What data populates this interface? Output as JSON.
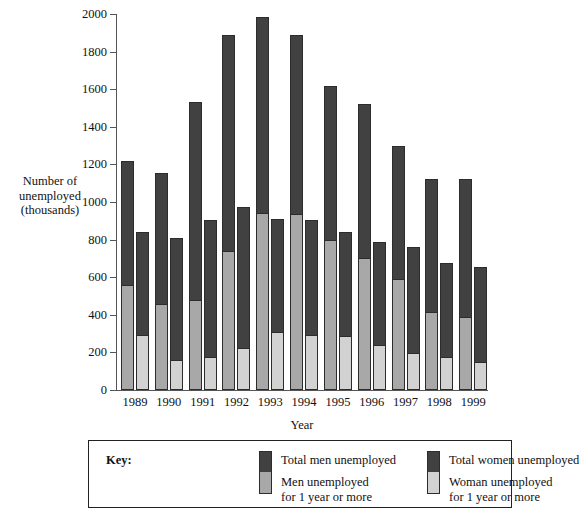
{
  "chart_data": {
    "type": "bar",
    "title": "",
    "xlabel": "Year",
    "ylabel": "Number of unemployed (thousands)",
    "ylim": [
      0,
      2000
    ],
    "ytick_step": 200,
    "yticks": [
      0,
      200,
      400,
      600,
      800,
      1000,
      1200,
      1400,
      1600,
      1800,
      2000
    ],
    "grid": false,
    "legend_position": "bottom",
    "categories": [
      "1989",
      "1990",
      "1991",
      "1992",
      "1993",
      "1994",
      "1995",
      "1996",
      "1997",
      "1998",
      "1999"
    ],
    "series": [
      {
        "name": "Total men unemployed",
        "key": "men_total",
        "color": "#414141",
        "values": [
          1220,
          1155,
          1530,
          1890,
          1985,
          1890,
          1615,
          1520,
          1300,
          1120,
          1120
        ]
      },
      {
        "name": "Men unemployed for 1 year or more",
        "key": "men_long",
        "color": "#a8a8a8",
        "values": [
          560,
          460,
          480,
          740,
          940,
          935,
          800,
          700,
          590,
          415,
          390
        ]
      },
      {
        "name": "Total women unemployed",
        "key": "women_total",
        "color": "#414141",
        "values": [
          840,
          810,
          905,
          975,
          910,
          905,
          840,
          785,
          760,
          675,
          655
        ]
      },
      {
        "name": "Woman unemployed for 1 year or more",
        "key": "women_long",
        "color": "#d2d2d2",
        "values": [
          290,
          160,
          175,
          225,
          310,
          290,
          285,
          240,
          195,
          175,
          150
        ]
      }
    ]
  },
  "axis": {
    "y_title_lines": [
      "Number of",
      "unemployed",
      "(thousands)"
    ],
    "x_title": "Year"
  },
  "legend": {
    "key_label": "Key:",
    "entries": [
      {
        "label": "Total men unemployed",
        "label2": "",
        "swatch": "dark"
      },
      {
        "label": "Total women unemployed",
        "label2": "",
        "swatch": "dark"
      },
      {
        "label": "Men unemployed",
        "label2": "for 1 year or more",
        "swatch": "men-light"
      },
      {
        "label": "Woman unemployed",
        "label2": "for 1 year or more",
        "swatch": "women-light"
      }
    ]
  },
  "colors": {
    "dark": "#414141",
    "men_light": "#a8a8a8",
    "women_light": "#d2d2d2",
    "outline": "#2c2c2c",
    "axis": "#555555"
  }
}
